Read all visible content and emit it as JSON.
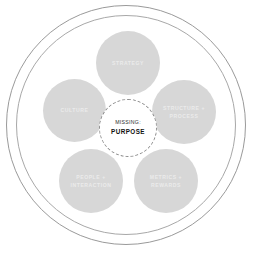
{
  "diagram": {
    "rings": [
      {
        "name": "outer-ring",
        "color": "#9a9a9a"
      },
      {
        "name": "inner-ring",
        "color": "#a8a8a8"
      }
    ],
    "node_fill_color": "#d7d7d7",
    "node_label_color": "#ebebeb",
    "center": {
      "line1": "MISSING:",
      "line2": "PURPOSE",
      "border_style": "dashed",
      "border_color": "#8d8d8d",
      "line1_color": "#2b2b2b",
      "line2_color": "#111111"
    },
    "nodes": [
      {
        "id": "strategy",
        "label": "STRATEGY",
        "position": "top"
      },
      {
        "id": "culture",
        "label": "CULTURE",
        "position": "left"
      },
      {
        "id": "structure-process",
        "label": "STRUCTURE +\nPROCESS",
        "position": "right"
      },
      {
        "id": "people-interaction",
        "label": "PEOPLE +\nINTERACTION",
        "position": "bottom-left"
      },
      {
        "id": "metrics-rewards",
        "label": "METRICS +\nREWARDS",
        "position": "bottom-right"
      }
    ]
  }
}
